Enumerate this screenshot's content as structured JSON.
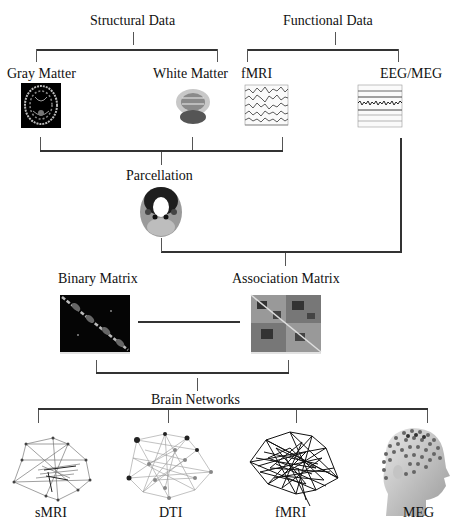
{
  "top": {
    "structural": {
      "label": "Structural Data",
      "gray": "Gray Matter",
      "white": "White Matter"
    },
    "functional": {
      "label": "Functional Data",
      "fmri": "fMRI",
      "eeg": "EEG/MEG"
    }
  },
  "middle": {
    "parcellation": "Parcellation",
    "binary": "Binary Matrix",
    "association": "Association Matrix"
  },
  "bottom": {
    "networks": "Brain Networks",
    "items": [
      "sMRI",
      "DTI",
      "fMRI",
      "MEG"
    ]
  }
}
